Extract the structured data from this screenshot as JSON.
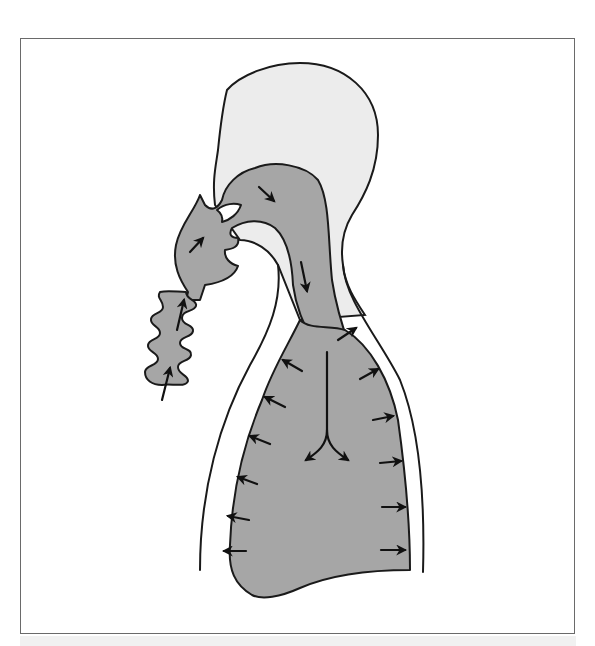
{
  "figure": {
    "title": "Airflow through the respiratory tract via breathing tube"
  },
  "colors": {
    "frame_border": "#6a6a6a",
    "head_fill": "#ececec",
    "airway_fill": "#a6a6a6",
    "outline": "#1a1a1a",
    "arrow": "#111111",
    "background": "#ffffff"
  },
  "elements": {
    "head": "head-silhouette",
    "tube": "corrugated-breathing-tube",
    "airway": "upper-airway",
    "trachea": "trachea",
    "lungs": "lung-cavity",
    "torso_outline": "torso-outline"
  },
  "arrows": {
    "count": 20,
    "groups": [
      {
        "name": "tube-inflow",
        "count": 2,
        "direction": "up"
      },
      {
        "name": "mouth-inflow",
        "count": 1,
        "direction": "up-right"
      },
      {
        "name": "nasopharynx",
        "count": 1,
        "direction": "down-right"
      },
      {
        "name": "trachea",
        "count": 1,
        "direction": "down"
      },
      {
        "name": "bronchi-split",
        "count": 2,
        "direction": "down-left/down-right"
      },
      {
        "name": "lung-left-wall",
        "count": 6,
        "direction": "left"
      },
      {
        "name": "lung-right-wall",
        "count": 6,
        "direction": "right"
      }
    ]
  }
}
